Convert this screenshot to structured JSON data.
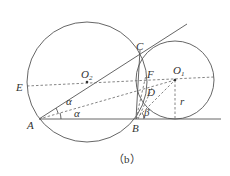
{
  "figure": {
    "caption": "（b）",
    "labels": {
      "E": "E",
      "O2": "O",
      "O2_sub": "2",
      "O1": "O",
      "O1_sub": "1",
      "C": "C",
      "F": "F",
      "D": "D",
      "A": "A",
      "B": "B",
      "alpha_upper": "α",
      "alpha_lower": "α",
      "beta": "β",
      "r": "r"
    },
    "points": {
      "A": [
        39,
        119
      ],
      "B": [
        136,
        119
      ],
      "C": [
        140,
        50
      ],
      "D": [
        150,
        91
      ],
      "E": [
        27,
        86
      ],
      "F": [
        146,
        75
      ],
      "O1": [
        175,
        80
      ],
      "O2": [
        87,
        82
      ]
    },
    "circles": [
      {
        "name": "big-circle-O2",
        "cx": 87,
        "cy": 82,
        "r": 60
      },
      {
        "name": "small-circle-O1",
        "cx": 175,
        "cy": 80,
        "r": 39
      }
    ],
    "colors": {
      "line": "#555555",
      "text": "#333333",
      "background": "#ffffff"
    }
  }
}
